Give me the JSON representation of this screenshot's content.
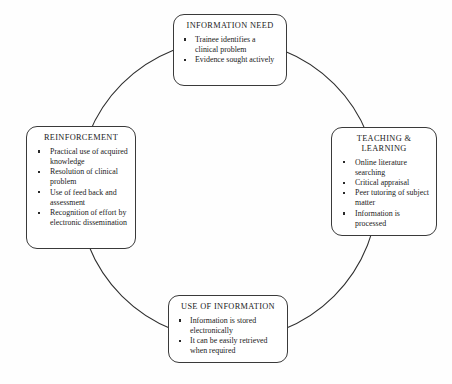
{
  "diagram": {
    "type": "cyclical-flow",
    "shape": "circle",
    "title": "",
    "nodes": [
      {
        "id": "information-need",
        "title": "INFORMATION NEED",
        "position": "top",
        "bullets": [
          "Trainee identifies a clinical problem",
          "Evidence sought actively"
        ]
      },
      {
        "id": "teaching-learning",
        "title": "TEACHING &\nLEARNING",
        "position": "right",
        "bullets": [
          "Online literature searching",
          "Critical appraisal",
          "Peer tutoring of subject matter",
          "Information is processed"
        ]
      },
      {
        "id": "use-of-information",
        "title": "USE OF INFORMATION",
        "position": "bottom",
        "bullets": [
          "Information is stored electronically",
          "It can be easily retrieved when required"
        ]
      },
      {
        "id": "reinforcement",
        "title": "REINFORCEMENT",
        "position": "left",
        "bullets": [
          "Practical use of acquired knowledge",
          "Resolution of clinical problem",
          "Use of feed back and assessment",
          "Recognition of effort by electronic dissemination"
        ]
      }
    ],
    "colors": {
      "background": "#fefefe",
      "box_border": "#3a3a3a",
      "box_fill": "#ffffff",
      "arc_stroke": "#2e2e2e",
      "text": "#1a1a1a"
    }
  }
}
